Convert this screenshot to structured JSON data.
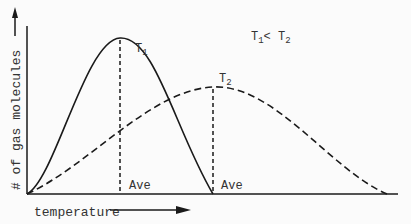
{
  "diagram": {
    "y_axis_label": "# of gas molecules",
    "x_axis_label": "temperature",
    "relation_label": {
      "t1": "T",
      "sub1": "1",
      "lt": "< ",
      "t2": "T",
      "sub2": "2"
    },
    "curves": [
      {
        "name": "T1",
        "letter": "T",
        "sub": "1",
        "style": "solid",
        "ave_label": "Ave"
      },
      {
        "name": "T2",
        "letter": "T",
        "sub": "2",
        "style": "dashed",
        "ave_label": "Ave"
      }
    ],
    "colors": {
      "line": "#1a1a1a",
      "text": "#333333",
      "background": "#fbfbfb"
    }
  }
}
